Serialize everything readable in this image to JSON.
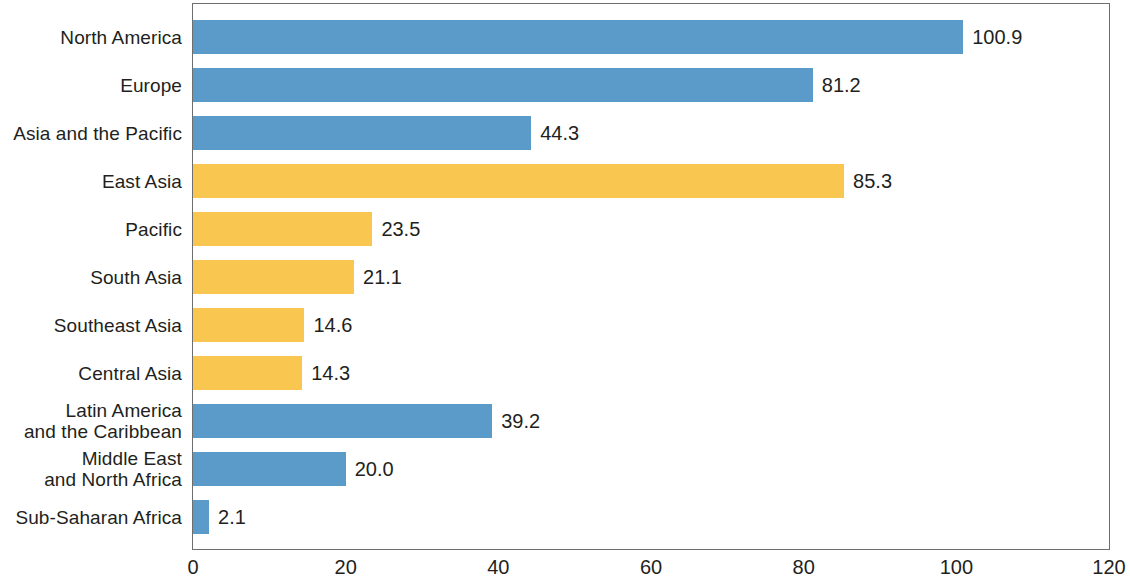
{
  "chart_data": {
    "type": "bar",
    "orientation": "horizontal",
    "title": "",
    "subtitle": "",
    "xlabel": "",
    "ylabel": "",
    "xlim": [
      0,
      120
    ],
    "ylim": null,
    "grid": false,
    "legend": null,
    "xticks": [
      "0",
      "20",
      "40",
      "60",
      "80",
      "100",
      "120"
    ],
    "xtick_values": [
      0,
      20,
      40,
      60,
      80,
      100,
      120
    ],
    "categories": [
      "North America",
      "Europe",
      "Asia and the Pacific",
      "East Asia",
      "Pacific",
      "South Asia",
      "Southeast Asia",
      "Central Asia",
      "Latin America\nand the Caribbean",
      "Middle East\nand North Africa",
      "Sub-Saharan Africa"
    ],
    "values": [
      100.9,
      81.2,
      44.3,
      85.3,
      23.5,
      21.1,
      14.6,
      14.3,
      39.2,
      20.0,
      2.1
    ],
    "value_labels": [
      "100.9",
      "81.2",
      "44.3",
      "85.3",
      "23.5",
      "21.1",
      "14.6",
      "14.3",
      "39.2",
      "20.0",
      "2.1"
    ],
    "bar_colors": [
      "#5b9bc9",
      "#5b9bc9",
      "#5b9bc9",
      "#f9c74f",
      "#f9c74f",
      "#f9c74f",
      "#f9c74f",
      "#f9c74f",
      "#5b9bc9",
      "#5b9bc9",
      "#5b9bc9"
    ],
    "series": [
      {
        "name": "",
        "values": [
          100.9,
          81.2,
          44.3,
          85.3,
          23.5,
          21.1,
          14.6,
          14.3,
          39.2,
          20.0,
          2.1
        ]
      }
    ],
    "colors": {
      "blue": "#5b9bc9",
      "yellow": "#f9c74f",
      "axis": "#6d6e70",
      "text": "#231f20",
      "background": "#ffffff"
    }
  }
}
